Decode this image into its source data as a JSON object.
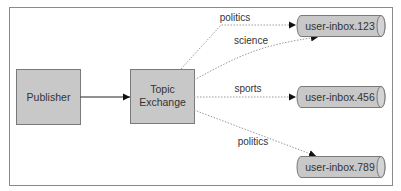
{
  "diagram": {
    "type": "message-routing",
    "colors": {
      "frame": "#8a8a8a",
      "box_fill": "#c8c8c8",
      "box_stroke": "#7a7a7a",
      "solid_edge": "#222222",
      "dotted_edge": "#9a9a9a",
      "text": "#333333"
    },
    "nodes": {
      "publisher": {
        "label": "Publisher",
        "shape": "rectangle"
      },
      "exchange": {
        "label_line1": "Topic",
        "label_line2": "Exchange",
        "shape": "rectangle"
      },
      "queue1": {
        "label": "user-inbox.123",
        "shape": "cylinder"
      },
      "queue2": {
        "label": "user-inbox.456",
        "shape": "cylinder"
      },
      "queue3": {
        "label": "user-inbox.789",
        "shape": "cylinder"
      }
    },
    "edges": [
      {
        "from": "Publisher",
        "to": "Topic Exchange",
        "label": "",
        "style": "solid"
      },
      {
        "from": "Topic Exchange",
        "to": "user-inbox.123",
        "label": "politics",
        "style": "dotted"
      },
      {
        "from": "Topic Exchange",
        "to": "user-inbox.123",
        "label": "science",
        "style": "dotted"
      },
      {
        "from": "Topic Exchange",
        "to": "user-inbox.456",
        "label": "sports",
        "style": "dotted"
      },
      {
        "from": "Topic Exchange",
        "to": "user-inbox.789",
        "label": "politics",
        "style": "dotted"
      }
    ]
  }
}
